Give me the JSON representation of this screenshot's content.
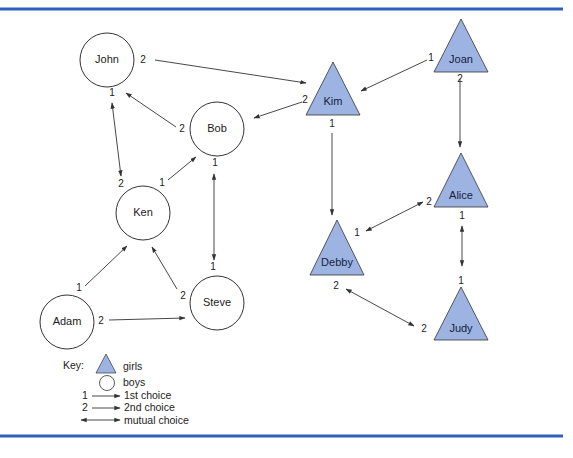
{
  "colors": {
    "rule": "#2f5fbf",
    "girl_fill": "#9db4e3",
    "boy_fill": "#ffffff",
    "stroke": "#333333"
  },
  "nodes": {
    "john": {
      "name": "John",
      "type": "boy"
    },
    "bob": {
      "name": "Bob",
      "type": "boy"
    },
    "ken": {
      "name": "Ken",
      "type": "boy"
    },
    "adam": {
      "name": "Adam",
      "type": "boy"
    },
    "steve": {
      "name": "Steve",
      "type": "boy"
    },
    "kim": {
      "name": "Kim",
      "type": "girl"
    },
    "joan": {
      "name": "Joan",
      "type": "girl"
    },
    "alice": {
      "name": "Alice",
      "type": "girl"
    },
    "debby": {
      "name": "Debby",
      "type": "girl"
    },
    "judy": {
      "name": "Judy",
      "type": "girl"
    }
  },
  "edges": [
    {
      "from": "John",
      "to": "Kim",
      "rank": "2",
      "mutual": false
    },
    {
      "from": "John",
      "to": "Ken",
      "rank": "1",
      "mutual": true,
      "rank_other": "2"
    },
    {
      "from": "Bob",
      "to": "John",
      "rank": "2",
      "mutual": false
    },
    {
      "from": "Bob",
      "to": "Steve",
      "rank": "1",
      "mutual": true,
      "rank_other": "1"
    },
    {
      "from": "Ken",
      "to": "Bob",
      "rank": "1",
      "mutual": false
    },
    {
      "from": "Adam",
      "to": "Ken",
      "rank": "1",
      "mutual": false
    },
    {
      "from": "Adam",
      "to": "Steve",
      "rank": "2",
      "mutual": false
    },
    {
      "from": "Steve",
      "to": "Ken",
      "rank": "2",
      "mutual": false
    },
    {
      "from": "Kim",
      "to": "Bob",
      "rank": "2",
      "mutual": false
    },
    {
      "from": "Kim",
      "to": "Debby",
      "rank": "1",
      "mutual": false
    },
    {
      "from": "Joan",
      "to": "Kim",
      "rank": "1",
      "mutual": false
    },
    {
      "from": "Joan",
      "to": "Alice",
      "rank": "2",
      "mutual": false
    },
    {
      "from": "Alice",
      "to": "Judy",
      "rank": "1",
      "mutual": true,
      "rank_other": "1"
    },
    {
      "from": "Alice",
      "to": "Debby",
      "rank": "2",
      "mutual": true,
      "rank_other": "1"
    },
    {
      "from": "Debby",
      "to": "Judy",
      "rank": "2",
      "mutual": true,
      "rank_other": "2"
    }
  ],
  "ranks": {
    "john_right": "2",
    "john_bottom": "1",
    "bob_left": "2",
    "bob_bottom": "1",
    "ken_topleft": "2",
    "ken_topright": "1",
    "adam_top": "1",
    "adam_right": "2",
    "steve_top": "1",
    "steve_left": "2",
    "kim_left": "2",
    "kim_bottom": "1",
    "joan_left": "1",
    "joan_bottom": "2",
    "alice_left": "2",
    "alice_bottom": "1",
    "debby_right": "1",
    "debby_bottom": "2",
    "judy_top": "1",
    "judy_left": "2"
  },
  "key": {
    "title": "Key:",
    "girls": "girls",
    "boys": "boys",
    "first_num": "1",
    "first": "1st choice",
    "second_num": "2",
    "second": "2nd choice",
    "mutual": "mutual choice"
  }
}
